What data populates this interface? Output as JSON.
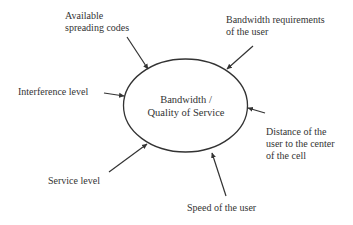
{
  "diagram": {
    "type": "hub-and-spoke influence diagram",
    "center": {
      "line1": "Bandwidth /",
      "line2": "Quality of Service"
    },
    "factors": [
      {
        "id": "available-spreading-codes",
        "lines": [
          "Available",
          "spreading codes"
        ],
        "position": "top-left"
      },
      {
        "id": "bandwidth-requirements",
        "lines": [
          "Bandwidth requirements",
          "of the user"
        ],
        "position": "top-right"
      },
      {
        "id": "interference-level",
        "lines": [
          "Interference level"
        ],
        "position": "left"
      },
      {
        "id": "distance-to-center",
        "lines": [
          "Distance of the",
          "user to the center",
          "of the cell"
        ],
        "position": "right"
      },
      {
        "id": "service-level",
        "lines": [
          "Service level"
        ],
        "position": "bottom-left"
      },
      {
        "id": "speed-of-user",
        "lines": [
          "Speed of the user"
        ],
        "position": "bottom"
      }
    ],
    "colors": {
      "stroke": "#333333",
      "text": "#333333",
      "background": "#ffffff"
    }
  }
}
